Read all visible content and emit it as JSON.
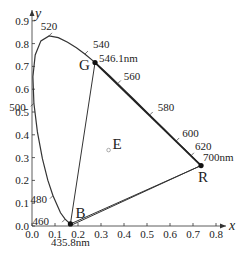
{
  "chart_data": {
    "type": "diagram",
    "xlabel": "x",
    "ylabel": "y",
    "xlim": [
      0.0,
      0.8
    ],
    "ylim": [
      0.0,
      0.9
    ],
    "x_ticks": [
      "0.0",
      "0.1",
      "0.2",
      "0.3",
      "0.4",
      "0.5",
      "0.6",
      "0.7",
      "0.8"
    ],
    "y_ticks": [
      "0.0",
      "0.1",
      "0.2",
      "0.3",
      "0.4",
      "0.5",
      "0.6",
      "0.7",
      "0.8",
      "0.9"
    ],
    "wavelength_labels": [
      {
        "label": "460",
        "x": 0.144,
        "y": 0.03
      },
      {
        "label": "480",
        "x": 0.091,
        "y": 0.133
      },
      {
        "label": "500",
        "x": 0.008,
        "y": 0.538
      },
      {
        "label": "520",
        "x": 0.074,
        "y": 0.834
      },
      {
        "label": "540",
        "x": 0.23,
        "y": 0.754
      },
      {
        "label": "560",
        "x": 0.373,
        "y": 0.625
      },
      {
        "label": "580",
        "x": 0.512,
        "y": 0.487
      },
      {
        "label": "600",
        "x": 0.627,
        "y": 0.373
      },
      {
        "label": "620",
        "x": 0.691,
        "y": 0.308
      }
    ],
    "primaries": [
      {
        "name": "R",
        "wavelength": "700nm",
        "x": 0.735,
        "y": 0.265
      },
      {
        "name": "G",
        "wavelength": "546.1nm",
        "x": 0.274,
        "y": 0.717
      },
      {
        "name": "B",
        "wavelength": "435.8nm",
        "x": 0.167,
        "y": 0.009
      }
    ],
    "white_point": {
      "name": "E",
      "x": 0.333,
      "y": 0.333
    },
    "spectral_locus": [
      [
        0.1741,
        0.005
      ],
      [
        0.1738,
        0.0049
      ],
      [
        0.173,
        0.0048
      ],
      [
        0.1666,
        0.0089
      ],
      [
        0.144,
        0.0297
      ],
      [
        0.1241,
        0.0578
      ],
      [
        0.0913,
        0.1327
      ],
      [
        0.0687,
        0.2007
      ],
      [
        0.0454,
        0.295
      ],
      [
        0.0235,
        0.4127
      ],
      [
        0.0082,
        0.5384
      ],
      [
        0.0039,
        0.6548
      ],
      [
        0.0139,
        0.7502
      ],
      [
        0.0389,
        0.812
      ],
      [
        0.0743,
        0.8338
      ],
      [
        0.1142,
        0.8262
      ],
      [
        0.1547,
        0.8059
      ],
      [
        0.1929,
        0.7816
      ],
      [
        0.2296,
        0.7543
      ],
      [
        0.2658,
        0.7243
      ],
      [
        0.3016,
        0.6923
      ],
      [
        0.3373,
        0.6589
      ],
      [
        0.3731,
        0.6245
      ],
      [
        0.4087,
        0.5896
      ],
      [
        0.4441,
        0.5547
      ],
      [
        0.4788,
        0.5202
      ],
      [
        0.5125,
        0.4866
      ],
      [
        0.5448,
        0.4544
      ],
      [
        0.5752,
        0.4242
      ],
      [
        0.6029,
        0.3965
      ],
      [
        0.627,
        0.3725
      ],
      [
        0.6482,
        0.3514
      ],
      [
        0.6658,
        0.334
      ],
      [
        0.6801,
        0.3197
      ],
      [
        0.6915,
        0.3083
      ],
      [
        0.7006,
        0.2993
      ],
      [
        0.7079,
        0.292
      ],
      [
        0.714,
        0.2859
      ],
      [
        0.719,
        0.2809
      ],
      [
        0.723,
        0.277
      ],
      [
        0.726,
        0.274
      ],
      [
        0.7283,
        0.2717
      ],
      [
        0.73,
        0.27
      ],
      [
        0.7311,
        0.2689
      ],
      [
        0.732,
        0.268
      ],
      [
        0.7327,
        0.2673
      ],
      [
        0.7334,
        0.2666
      ],
      [
        0.734,
        0.266
      ],
      [
        0.7344,
        0.2656
      ],
      [
        0.7346,
        0.2654
      ],
      [
        0.7347,
        0.2653
      ]
    ]
  },
  "labels": {
    "x_axis": "x",
    "y_axis": "y",
    "R": "R",
    "G": "G",
    "B": "B",
    "E": "E",
    "R_wl": "700nm",
    "G_wl": "546.1nm",
    "B_wl": "435.8nm"
  }
}
